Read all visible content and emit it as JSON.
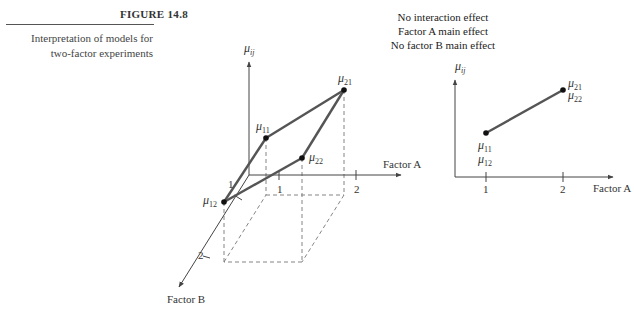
{
  "figure": {
    "number": "FIGURE 14.8",
    "caption_lines": [
      "Interpretation of models for",
      "two-factor experiments"
    ]
  },
  "effects_text": [
    "No interaction effect",
    "Factor A main effect",
    "No factor B main effect"
  ],
  "left_plot": {
    "y_axis_label": "μ",
    "y_axis_sub": "ij",
    "x_axis_label": "Factor A",
    "z_axis_label": "Factor B",
    "x_ticks": [
      "1",
      "2"
    ],
    "z_ticks": [
      "1",
      "2"
    ],
    "points": [
      {
        "name": "μ",
        "sub": "11"
      },
      {
        "name": "μ",
        "sub": "21"
      },
      {
        "name": "μ",
        "sub": "22"
      },
      {
        "name": "μ",
        "sub": "12"
      }
    ]
  },
  "right_plot": {
    "y_axis_label": "μ",
    "y_axis_sub": "ij",
    "x_axis_label": "Factor A",
    "x_ticks": [
      "1",
      "2"
    ],
    "point_labels": [
      {
        "line1": "μ",
        "sub1": "11",
        "line2": "μ",
        "sub2": "12"
      },
      {
        "line1": "μ",
        "sub1": "21",
        "line2": "μ",
        "sub2": "22"
      }
    ]
  },
  "colors": {
    "line": "#555555",
    "axis": "#444444",
    "dash": "#777777",
    "point": "#111111"
  }
}
